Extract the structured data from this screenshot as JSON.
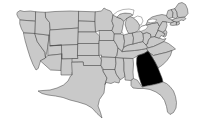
{
  "map": {
    "title": "United States map with Georgia highlighted",
    "projection": "albers-usa-simplified",
    "viewbox": "0 0 212 131",
    "background_color": "#ffffff",
    "default_state_color": "#c9c9c9",
    "highlight_color": "#000000",
    "border_color": "#4a4a4a",
    "lake_color": "#ffffff",
    "highlighted_states": [
      "GA"
    ],
    "legend": null,
    "labels_visible": false,
    "states": [
      {
        "code": "WA",
        "name": "Washington",
        "highlighted": false
      },
      {
        "code": "OR",
        "name": "Oregon",
        "highlighted": false
      },
      {
        "code": "CA",
        "name": "California",
        "highlighted": false
      },
      {
        "code": "NV",
        "name": "Nevada",
        "highlighted": false
      },
      {
        "code": "ID",
        "name": "Idaho",
        "highlighted": false
      },
      {
        "code": "MT",
        "name": "Montana",
        "highlighted": false
      },
      {
        "code": "WY",
        "name": "Wyoming",
        "highlighted": false
      },
      {
        "code": "UT",
        "name": "Utah",
        "highlighted": false
      },
      {
        "code": "AZ",
        "name": "Arizona",
        "highlighted": false
      },
      {
        "code": "CO",
        "name": "Colorado",
        "highlighted": false
      },
      {
        "code": "NM",
        "name": "New Mexico",
        "highlighted": false
      },
      {
        "code": "ND",
        "name": "North Dakota",
        "highlighted": false
      },
      {
        "code": "SD",
        "name": "South Dakota",
        "highlighted": false
      },
      {
        "code": "NE",
        "name": "Nebraska",
        "highlighted": false
      },
      {
        "code": "KS",
        "name": "Kansas",
        "highlighted": false
      },
      {
        "code": "OK",
        "name": "Oklahoma",
        "highlighted": false
      },
      {
        "code": "TX",
        "name": "Texas",
        "highlighted": false
      },
      {
        "code": "MN",
        "name": "Minnesota",
        "highlighted": false
      },
      {
        "code": "IA",
        "name": "Iowa",
        "highlighted": false
      },
      {
        "code": "MO",
        "name": "Missouri",
        "highlighted": false
      },
      {
        "code": "AR",
        "name": "Arkansas",
        "highlighted": false
      },
      {
        "code": "LA",
        "name": "Louisiana",
        "highlighted": false
      },
      {
        "code": "WI",
        "name": "Wisconsin",
        "highlighted": false
      },
      {
        "code": "IL",
        "name": "Illinois",
        "highlighted": false
      },
      {
        "code": "MS",
        "name": "Mississippi",
        "highlighted": false
      },
      {
        "code": "AL",
        "name": "Alabama",
        "highlighted": false
      },
      {
        "code": "TN",
        "name": "Tennessee",
        "highlighted": false
      },
      {
        "code": "KY",
        "name": "Kentucky",
        "highlighted": false
      },
      {
        "code": "IN",
        "name": "Indiana",
        "highlighted": false
      },
      {
        "code": "MI",
        "name": "Michigan",
        "highlighted": false
      },
      {
        "code": "OH",
        "name": "Ohio",
        "highlighted": false
      },
      {
        "code": "WV",
        "name": "West Virginia",
        "highlighted": false
      },
      {
        "code": "VA",
        "name": "Virginia",
        "highlighted": false
      },
      {
        "code": "NC",
        "name": "North Carolina",
        "highlighted": false
      },
      {
        "code": "SC",
        "name": "South Carolina",
        "highlighted": false
      },
      {
        "code": "GA",
        "name": "Georgia",
        "highlighted": true
      },
      {
        "code": "FL",
        "name": "Florida",
        "highlighted": false
      },
      {
        "code": "PA",
        "name": "Pennsylvania",
        "highlighted": false
      },
      {
        "code": "NY",
        "name": "New York",
        "highlighted": false
      },
      {
        "code": "MD",
        "name": "Maryland",
        "highlighted": false
      },
      {
        "code": "DE",
        "name": "Delaware",
        "highlighted": false
      },
      {
        "code": "NJ",
        "name": "New Jersey",
        "highlighted": false
      },
      {
        "code": "CT",
        "name": "Connecticut",
        "highlighted": false
      },
      {
        "code": "RI",
        "name": "Rhode Island",
        "highlighted": false
      },
      {
        "code": "MA",
        "name": "Massachusetts",
        "highlighted": false
      },
      {
        "code": "VT",
        "name": "Vermont",
        "highlighted": false
      },
      {
        "code": "NH",
        "name": "New Hampshire",
        "highlighted": false
      },
      {
        "code": "ME",
        "name": "Maine",
        "highlighted": false
      }
    ],
    "lakes": [
      {
        "name": "Lake Superior"
      },
      {
        "name": "Lake Michigan"
      },
      {
        "name": "Lake Huron"
      },
      {
        "name": "Lake Erie"
      },
      {
        "name": "Lake Ontario"
      }
    ]
  }
}
